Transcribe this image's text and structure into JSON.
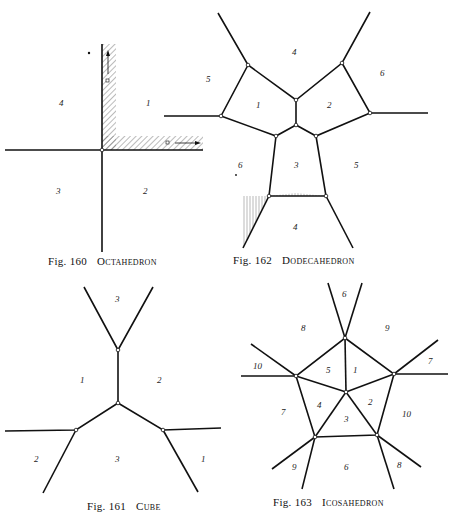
{
  "figures": [
    {
      "id": "fig160",
      "number": "Fig. 160",
      "title": "Octahedron",
      "labels": [
        "4",
        "1",
        "3",
        "2"
      ]
    },
    {
      "id": "fig162",
      "number": "Fig. 162",
      "title": "Dodecahedron",
      "labels": [
        "4",
        "5",
        "1",
        "2",
        "6",
        "6",
        "3",
        "5",
        "4"
      ]
    },
    {
      "id": "fig161",
      "number": "Fig. 161",
      "title": "Cube",
      "labels": [
        "3",
        "1",
        "2",
        "2",
        "3",
        "1"
      ]
    },
    {
      "id": "fig163",
      "number": "Fig. 163",
      "title": "Icosahedron",
      "labels": [
        "6",
        "8",
        "9",
        "10",
        "5",
        "1",
        "7",
        "7",
        "4",
        "2",
        "10",
        "3",
        "9",
        "6",
        "8"
      ]
    }
  ]
}
